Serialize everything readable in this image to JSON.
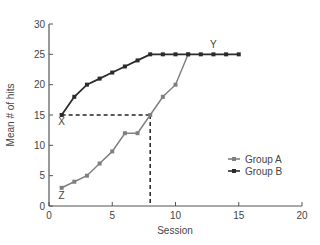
{
  "chart_data": {
    "type": "line",
    "title": "",
    "xlabel": "Session",
    "ylabel": "Mean # of hits",
    "xlim": [
      0,
      20
    ],
    "ylim": [
      0,
      30
    ],
    "xticks": [
      0,
      5,
      10,
      15,
      20
    ],
    "yticks": [
      0,
      5,
      10,
      15,
      20,
      25,
      30
    ],
    "grid": false,
    "legend_position": "center-right",
    "series": [
      {
        "name": "Group A",
        "color": "#808080",
        "marker": "circle",
        "x": [
          1,
          2,
          3,
          4,
          5,
          6,
          7,
          8,
          9,
          10,
          11
        ],
        "values": [
          3,
          4,
          5,
          7,
          9,
          12,
          12,
          15,
          18,
          20,
          25
        ]
      },
      {
        "name": "Group B",
        "color": "#2b2b2b",
        "marker": "square",
        "x": [
          1,
          2,
          3,
          4,
          5,
          6,
          7,
          8,
          9,
          10,
          11,
          12,
          13,
          14,
          15
        ],
        "values": [
          15,
          18,
          20,
          21,
          22,
          23,
          24,
          25,
          25,
          25,
          25,
          25,
          25,
          25,
          25
        ]
      }
    ],
    "annotations": [
      {
        "label": "X",
        "x": 1,
        "y": 15,
        "note": "below Group B start point"
      },
      {
        "label": "Y",
        "x": 13,
        "y": 25,
        "note": "above Group B plateau"
      },
      {
        "label": "Z",
        "x": 1,
        "y": 3,
        "note": "below Group A start point"
      }
    ],
    "reference_lines": [
      {
        "type": "dashed-horizontal",
        "from": [
          1,
          15
        ],
        "to": [
          8,
          15
        ]
      },
      {
        "type": "dashed-vertical",
        "from": [
          8,
          15
        ],
        "to": [
          8,
          0
        ]
      }
    ]
  }
}
